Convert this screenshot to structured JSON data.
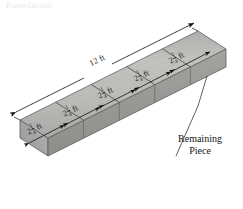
{
  "figure": {
    "title_fragment": "Foundation",
    "total_length": {
      "value": "12 ft",
      "whole": "12",
      "unit": "ft"
    },
    "callout": {
      "line1": "Remaining",
      "line2": "Piece"
    },
    "segments": [
      {
        "id": "seg-1",
        "whole": "2",
        "num": "1",
        "den": "4",
        "unit": "ft"
      },
      {
        "id": "seg-2",
        "whole": "2",
        "num": "1",
        "den": "4",
        "unit": "ft"
      },
      {
        "id": "seg-3",
        "whole": "2",
        "num": "1",
        "den": "4",
        "unit": "ft"
      },
      {
        "id": "seg-4",
        "whole": "2",
        "num": "1",
        "den": "4",
        "unit": "ft"
      },
      {
        "id": "seg-5",
        "whole": "2",
        "num": "1",
        "den": "4",
        "unit": "ft"
      }
    ],
    "colors": {
      "board_top": "#b3b3b3",
      "board_top_light": "#c6c6c4",
      "board_front": "#9b9b9b",
      "board_edge": "#8d8d8d",
      "outline": "#4d4d4d",
      "dimension_line": "#111111",
      "text": "#1a1a1a",
      "background": "#ffffff"
    }
  }
}
